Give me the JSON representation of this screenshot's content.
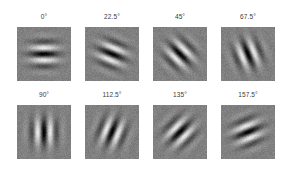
{
  "figure": {
    "background_color": "#ffffff",
    "label_color": "#3a3a3a",
    "patch_background_color": "#808080",
    "rows": 2,
    "columns": 4,
    "patch_size_px": 54
  },
  "chart_data": {
    "type": "heatmap",
    "title": "",
    "subtitle": "",
    "xlabel": "",
    "ylabel": "",
    "grid": false,
    "legend": "none",
    "panels": [
      {
        "index": 0,
        "label": "0°",
        "orientation_deg": 0,
        "row": 0,
        "column": 0,
        "x": 17,
        "y": 27,
        "stripe_appearance": "horizontal bands"
      },
      {
        "index": 1,
        "label": "22.5°",
        "orientation_deg": 22.5,
        "row": 0,
        "column": 1,
        "x": 85,
        "y": 27,
        "stripe_appearance": "shallow diagonal bands rising to the right"
      },
      {
        "index": 2,
        "label": "45°",
        "orientation_deg": 45,
        "row": 0,
        "column": 2,
        "x": 153,
        "y": 27,
        "stripe_appearance": "diagonal bands rising to the right"
      },
      {
        "index": 3,
        "label": "67.5°",
        "orientation_deg": 67.5,
        "row": 0,
        "column": 3,
        "x": 221,
        "y": 27,
        "stripe_appearance": "steep diagonal bands near vertical"
      },
      {
        "index": 4,
        "label": "90°",
        "orientation_deg": 90,
        "row": 1,
        "column": 0,
        "x": 17,
        "y": 105,
        "stripe_appearance": "vertical bands"
      },
      {
        "index": 5,
        "label": "112.5°",
        "orientation_deg": 112.5,
        "row": 1,
        "column": 1,
        "x": 85,
        "y": 105,
        "stripe_appearance": "steep diagonal bands falling to the right"
      },
      {
        "index": 6,
        "label": "135°",
        "orientation_deg": 135,
        "row": 1,
        "column": 2,
        "x": 153,
        "y": 105,
        "stripe_appearance": "diagonal bands falling to the right"
      },
      {
        "index": 7,
        "label": "157.5°",
        "orientation_deg": 157.5,
        "row": 1,
        "column": 3,
        "x": 221,
        "y": 105,
        "stripe_appearance": "shallow diagonal bands falling to the right"
      }
    ],
    "gabor_parameters": {
      "wavelength_px": 13,
      "sigma_px": 9.5,
      "phase": 0,
      "noise_amplitude": 18,
      "mean_level": 128
    }
  }
}
